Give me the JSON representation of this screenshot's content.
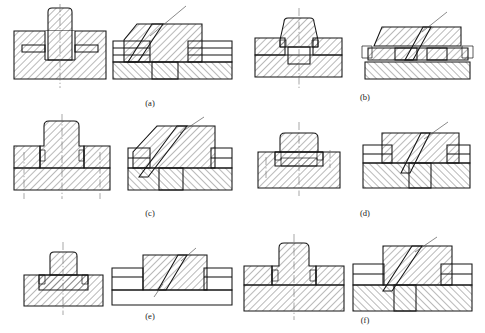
{
  "figure": {
    "kind": "engineering-drawing",
    "background_color": "#ffffff",
    "line_color": "#141414",
    "hatch_color": "#141414",
    "centerline_color": "#6b6b6b",
    "panel_count": 6,
    "views_per_panel": 2,
    "captions": [
      {
        "id": "a",
        "label": "(a)",
        "x": 150,
        "y": 106
      },
      {
        "id": "b",
        "label": "(b)",
        "x": 365,
        "y": 100
      },
      {
        "id": "c",
        "label": "(c)",
        "x": 150,
        "y": 216
      },
      {
        "id": "d",
        "label": "(d)",
        "x": 365,
        "y": 216
      },
      {
        "id": "e",
        "label": "(e)",
        "x": 150,
        "y": 319
      },
      {
        "id": "f",
        "label": "(f)",
        "x": 365,
        "y": 323
      }
    ],
    "panels": [
      {
        "id": "a",
        "caption": "(a)",
        "front_view_name": "front-section-a",
        "side_view_name": "side-section-a",
        "features": [
          "rounded-top boss",
          "slotted base plate",
          "two horizontal recesses",
          "vertical centerline"
        ]
      },
      {
        "id": "b",
        "caption": "(b)",
        "front_view_name": "front-section-b",
        "side_view_name": "side-section-b",
        "features": [
          "flared boss",
          "central square pocket",
          "stepped base plate",
          "vertical centerline"
        ]
      },
      {
        "id": "c",
        "caption": "(c)",
        "front_view_name": "front-section-c",
        "side_view_name": "side-section-c",
        "features": [
          "tall rounded boss",
          "wide shoulder",
          "three centerlines",
          "inclined key"
        ]
      },
      {
        "id": "d",
        "caption": "(d)",
        "front_view_name": "front-section-d",
        "side_view_name": "side-section-d",
        "features": [
          "low rounded boss",
          "shallow seat",
          "cross centerlines",
          "inclined key"
        ]
      },
      {
        "id": "e",
        "caption": "(e)",
        "front_view_name": "front-section-e",
        "side_view_name": "side-section-e",
        "features": [
          "small boss",
          "single plate",
          "unhatched lower plate",
          "inclined key"
        ]
      },
      {
        "id": "f",
        "caption": "(f)",
        "front_view_name": "front-section-f",
        "side_view_name": "side-section-f",
        "features": [
          "tall boss",
          "two-layer base",
          "inclined key",
          "vertical centerline"
        ]
      }
    ]
  }
}
